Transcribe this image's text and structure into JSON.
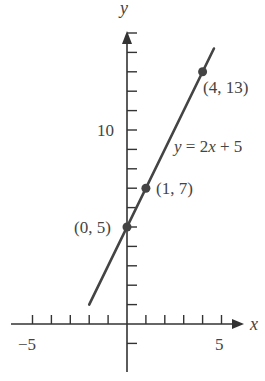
{
  "chart_data": {
    "type": "line",
    "title": "",
    "xlabel": "x",
    "ylabel": "y",
    "xlim": [
      -6,
      6.5
    ],
    "ylim": [
      -3,
      16
    ],
    "x_tick_labels": [
      "-5",
      "5"
    ],
    "y_tick_labels": [
      "10"
    ],
    "x_ticks": [
      -5,
      -4,
      -3,
      -2,
      -1,
      1,
      2,
      3,
      4,
      5
    ],
    "y_ticks": [
      -1,
      1,
      2,
      3,
      4,
      5,
      6,
      7,
      8,
      9,
      10,
      11,
      12,
      13,
      14,
      15
    ],
    "grid": false,
    "series": [
      {
        "name": "y = 2x + 5",
        "equation": "y = 2x + 5",
        "x": [
          -2,
          4.6
        ],
        "y": [
          1,
          14.2
        ]
      }
    ],
    "points": [
      {
        "x": 0,
        "y": 5,
        "label": "(0, 5)"
      },
      {
        "x": 1,
        "y": 7,
        "label": "(1, 7)"
      },
      {
        "x": 4,
        "y": 13,
        "label": "(4, 13)"
      }
    ],
    "annotations": [
      "y = 2x + 5",
      "(0, 5)",
      "(1, 7)",
      "(4, 13)"
    ]
  },
  "labels": {
    "x_axis": "x",
    "y_axis": "y",
    "x_neg5": "−5",
    "x_pos5": "5",
    "y_10": "10",
    "equation": "y = 2x + 5",
    "p0": "(0, 5)",
    "p1": "(1, 7)",
    "p2": "(4, 13)"
  },
  "colors": {
    "axis": "#333333",
    "line": "#444444",
    "point": "#444444"
  }
}
